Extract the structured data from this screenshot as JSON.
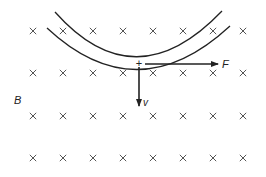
{
  "diagram": {
    "field_label": "B",
    "field_direction": "into-page",
    "field_symbol": "×",
    "charge_symbol": "+",
    "force_label": "F",
    "velocity_label": "v",
    "colors": {
      "ink": "#222222",
      "field_mark": "#555555",
      "background": "#ffffff"
    },
    "grid": {
      "columns_x": [
        33,
        63,
        93,
        123,
        153,
        183,
        213,
        243
      ],
      "rows_y": [
        31,
        73,
        116,
        158
      ]
    },
    "trajectory_arcs": [
      {
        "name": "outer-arc",
        "path": "M 55 12 Q 135 102 222 11"
      },
      {
        "name": "inner-arc",
        "path": "M 47 28 Q 137 112 230 26"
      }
    ],
    "charge": {
      "x": 139,
      "y": 63
    },
    "force_vector": {
      "x1": 145,
      "y1": 64,
      "x2": 218,
      "y2": 64,
      "label_x": 222,
      "label_y": 68
    },
    "velocity_vector": {
      "x1": 139,
      "y1": 67,
      "x2": 139,
      "y2": 106,
      "label_x": 143,
      "label_y": 106
    },
    "field_label_pos": {
      "x": 14,
      "y": 104
    }
  }
}
